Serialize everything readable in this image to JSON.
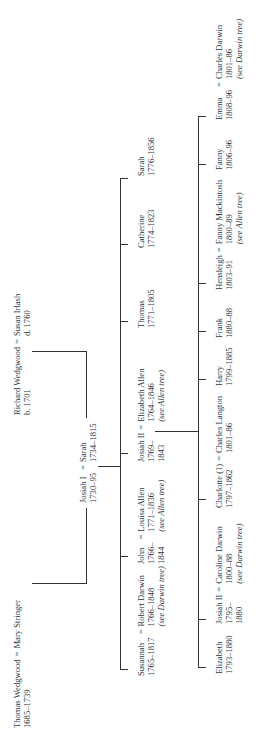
{
  "diagram": {
    "type": "family-tree",
    "orientation": "rotated-90-ccw",
    "generation_0": {
      "couple_1": {
        "husband": "Thomas Wedgwood",
        "husband_dates": "1685–1739",
        "wife": "Mary Stringer",
        "wife_dates": ""
      },
      "couple_2": {
        "husband": "Richard Wedgwood",
        "husband_dates": "b. 1701",
        "wife": "Susan Irlash",
        "wife_dates": "d. 1760"
      }
    },
    "generation_1": {
      "couple": {
        "husband": "Josiah I",
        "husband_dates": "1730–95",
        "wife": "Sarah",
        "wife_dates": "1734–1815"
      }
    },
    "generation_2": [
      {
        "name": "Susannah",
        "dates": "1765–1817",
        "spouse": "Robert Darwin",
        "spouse_dates": "1766–1848",
        "note": "(see Darwin tree)"
      },
      {
        "name": "John",
        "dates": "1766–",
        "dates2": "1844",
        "spouse": "Louisa Allen",
        "spouse_dates": "1771–1836",
        "note": "(see Allen tree)"
      },
      {
        "name": "Josiah II",
        "dates": "1769–",
        "dates2": "1843",
        "spouse": "Elizabeth Allen",
        "spouse_dates": "1764–1846",
        "note": "(see Allen tree)"
      },
      {
        "name": "Thomas",
        "dates": "1771–1805"
      },
      {
        "name": "Catherine",
        "dates": "1774–1823"
      },
      {
        "name": "Sarah",
        "dates": "1776–1856"
      }
    ],
    "generation_3": [
      {
        "name": "Elizabeth",
        "dates": "1793–1880"
      },
      {
        "name": "Josiah II",
        "dates": "1795–",
        "dates2": "1880",
        "spouse": "Caroline Darwin",
        "spouse_dates": "1800–88",
        "note": "(see Darwin tree)"
      },
      {
        "name": "Charlotte (1)",
        "dates": "1797–1862",
        "spouse": "Charles Langton",
        "spouse_dates": "1801–86"
      },
      {
        "name": "Harry",
        "dates": "1799–1885"
      },
      {
        "name": "Frank",
        "dates": "1880–88"
      },
      {
        "name": "Hensleigh",
        "dates": "1803–91",
        "spouse": "Fanny Mackintosh",
        "spouse_dates": "1800–89",
        "note": "(see Allen tree)"
      },
      {
        "name": "Fanny",
        "dates": "1806–96"
      },
      {
        "name": "Emma",
        "dates": "1808–96",
        "spouse": "Charles Darwin",
        "spouse_dates": "1801–86",
        "note": "(see Darwin tree)"
      }
    ],
    "marriage_symbol": "="
  }
}
